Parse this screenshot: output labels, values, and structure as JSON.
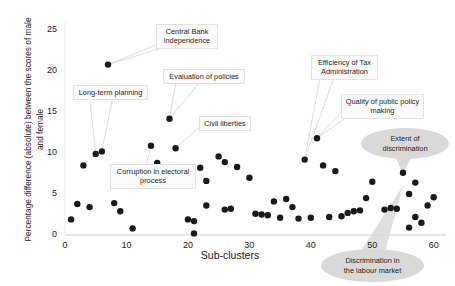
{
  "chart_data": {
    "type": "scatter",
    "title": "",
    "xlabel": "Sub-clusters",
    "ylabel": "Percentage difference (absolute) between the scores of male and female",
    "xlim": [
      0,
      62
    ],
    "ylim": [
      0,
      26
    ],
    "xticks": [
      0,
      10,
      20,
      30,
      40,
      50,
      60
    ],
    "yticks": [
      0,
      5,
      10,
      15,
      20,
      25
    ],
    "grid": false,
    "legend": "none",
    "marker_color": "#1a1a1a",
    "points": [
      {
        "x": 1,
        "y": 1.9
      },
      {
        "x": 2,
        "y": 3.8
      },
      {
        "x": 3,
        "y": 8.5
      },
      {
        "x": 4,
        "y": 3.4
      },
      {
        "x": 5,
        "y": 9.9
      },
      {
        "x": 6,
        "y": 10.2
      },
      {
        "x": 7,
        "y": 20.8
      },
      {
        "x": 8,
        "y": 3.9
      },
      {
        "x": 9,
        "y": 2.9
      },
      {
        "x": 11,
        "y": 0.8
      },
      {
        "x": 14,
        "y": 10.9
      },
      {
        "x": 15,
        "y": 8.8
      },
      {
        "x": 17,
        "y": 14.2
      },
      {
        "x": 18,
        "y": 7.6
      },
      {
        "x": 18,
        "y": 10.6
      },
      {
        "x": 20,
        "y": 1.9
      },
      {
        "x": 21,
        "y": 1.7
      },
      {
        "x": 21,
        "y": 0.2
      },
      {
        "x": 22,
        "y": 8.2
      },
      {
        "x": 23,
        "y": 6.6
      },
      {
        "x": 23,
        "y": 3.6
      },
      {
        "x": 25,
        "y": 9.6
      },
      {
        "x": 26,
        "y": 8.9
      },
      {
        "x": 26,
        "y": 3.1
      },
      {
        "x": 27,
        "y": 3.2
      },
      {
        "x": 28,
        "y": 8.3
      },
      {
        "x": 30,
        "y": 7.0
      },
      {
        "x": 31,
        "y": 2.6
      },
      {
        "x": 32,
        "y": 2.5
      },
      {
        "x": 33,
        "y": 2.4
      },
      {
        "x": 34,
        "y": 4.1
      },
      {
        "x": 35,
        "y": 2.1
      },
      {
        "x": 36,
        "y": 4.4
      },
      {
        "x": 37,
        "y": 3.4
      },
      {
        "x": 38,
        "y": 2.0
      },
      {
        "x": 39,
        "y": 9.2
      },
      {
        "x": 40,
        "y": 2.1
      },
      {
        "x": 41,
        "y": 11.8
      },
      {
        "x": 42,
        "y": 8.5
      },
      {
        "x": 43,
        "y": 2.2
      },
      {
        "x": 44,
        "y": 7.8
      },
      {
        "x": 45,
        "y": 2.3
      },
      {
        "x": 46,
        "y": 2.7
      },
      {
        "x": 47,
        "y": 2.9
      },
      {
        "x": 48,
        "y": 3.0
      },
      {
        "x": 49,
        "y": 4.5
      },
      {
        "x": 50,
        "y": 6.5
      },
      {
        "x": 52,
        "y": 3.1
      },
      {
        "x": 53,
        "y": 3.3
      },
      {
        "x": 54,
        "y": 3.2
      },
      {
        "x": 55,
        "y": 7.6
      },
      {
        "x": 56,
        "y": 5.0
      },
      {
        "x": 56,
        "y": 0.9
      },
      {
        "x": 57,
        "y": 2.2
      },
      {
        "x": 57,
        "y": 6.4
      },
      {
        "x": 58,
        "y": 1.5
      },
      {
        "x": 59,
        "y": 3.6
      },
      {
        "x": 60,
        "y": 4.6
      }
    ],
    "annotations": [
      {
        "id": "central-bank-independence",
        "text": "Central Bank\nindependence",
        "target_x": 7,
        "target_y": 20.8
      },
      {
        "id": "evaluation-of-policies",
        "text": "Evaluation of policies",
        "target_x": 17,
        "target_y": 14.2
      },
      {
        "id": "long-term-planning",
        "text": "Long-term planning",
        "target_x": 5,
        "target_y": 9.9
      },
      {
        "id": "civil-liberties",
        "text": "Civil liberties",
        "target_x": 18,
        "target_y": 10.6
      },
      {
        "id": "corruption-in-electoral-process",
        "text": "Corruption in electoral\nprocess",
        "target_x": 14,
        "target_y": 10.9
      },
      {
        "id": "efficiency-of-tax-administration",
        "text": "Efficiency of Tax\nAdministration",
        "target_x": 39,
        "target_y": 9.2
      },
      {
        "id": "quality-of-public-policy-making",
        "text": "Quality of public policy\nmaking",
        "target_x": 41,
        "target_y": 11.8
      },
      {
        "id": "extent-of-discrimination",
        "text": "Extent of\ndiscrimination",
        "target_x": 55,
        "target_y": 7.6
      },
      {
        "id": "discrimination-in-the-labour-market",
        "text": "Discrimination in\nthe labour market",
        "target_x": 55,
        "target_y": 0.4
      }
    ]
  },
  "axis": {
    "xticks": [
      "0",
      "10",
      "20",
      "30",
      "40",
      "50",
      "60"
    ],
    "yticks": [
      "0",
      "5",
      "10",
      "15",
      "20",
      "25"
    ],
    "xlabel": "Sub-clusters",
    "ylabel": "Percentage difference (absolute) between the\nscores of male and female"
  },
  "labels": {
    "central_bank": "Central Bank\nindependence",
    "evaluation": "Evaluation of policies",
    "long_term": "Long-term planning",
    "civil_liberties": "Civil liberties",
    "corruption": "Corruption in electoral\nprocess",
    "tax_admin": "Efficiency of Tax\nAdministration",
    "policy_making": "Quality of public policy\nmaking",
    "extent_discrimination": "Extent of\ndiscrimination",
    "labour_market": "Discrimination in\nthe labour market"
  }
}
